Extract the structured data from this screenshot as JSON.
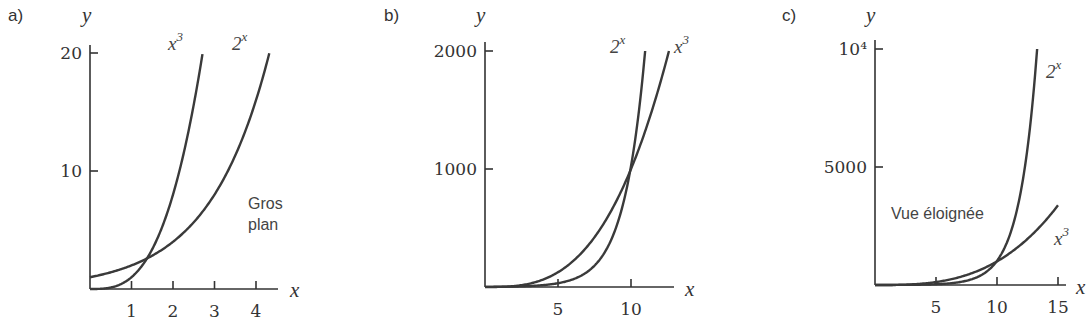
{
  "chart_data": [
    {
      "panel": "a)",
      "type": "line",
      "title": "",
      "xlabel": "x",
      "ylabel": "y",
      "xlim": [
        0,
        4.5
      ],
      "ylim": [
        0,
        20
      ],
      "xticks": [
        1,
        2,
        3,
        4
      ],
      "yticks": [
        10,
        20
      ],
      "ytick_labels": [
        "10",
        "20"
      ],
      "annotation": "Gros\nplan",
      "series": [
        {
          "name": "x^3",
          "label": "x",
          "sup": "3",
          "func": "cube",
          "x": [
            0,
            0.5,
            1,
            1.26,
            1.5,
            2,
            2.5,
            2.71
          ],
          "values": [
            0,
            0.125,
            1,
            2,
            3.375,
            8,
            15.625,
            20
          ]
        },
        {
          "name": "2^x",
          "label": "2",
          "sup": "x",
          "func": "exp2",
          "x": [
            0,
            1,
            1.37,
            2,
            3,
            4,
            4.32
          ],
          "values": [
            1,
            2,
            2.59,
            4,
            8,
            16,
            20
          ]
        }
      ]
    },
    {
      "panel": "b)",
      "type": "line",
      "title": "",
      "xlabel": "x",
      "ylabel": "y",
      "xlim": [
        0,
        13.5
      ],
      "ylim": [
        0,
        2000
      ],
      "xticks": [
        5,
        10
      ],
      "yticks": [
        1000,
        2000
      ],
      "ytick_labels": [
        "1000",
        "2000"
      ],
      "annotation": "",
      "series": [
        {
          "name": "2^x",
          "label": "2",
          "sup": "x",
          "func": "exp2",
          "x": [
            0,
            5,
            8,
            9.94,
            10,
            10.97
          ],
          "values": [
            1,
            32,
            256,
            982,
            1024,
            2000
          ]
        },
        {
          "name": "x^3",
          "label": "x",
          "sup": "3",
          "func": "cube",
          "x": [
            0,
            5,
            8,
            9.94,
            10,
            12.6
          ],
          "values": [
            0,
            125,
            512,
            982,
            1000,
            2000
          ]
        }
      ]
    },
    {
      "panel": "c)",
      "type": "line",
      "title": "",
      "xlabel": "x",
      "ylabel": "y",
      "xlim": [
        0,
        16
      ],
      "ylim": [
        0,
        10000
      ],
      "xticks": [
        5,
        10,
        15
      ],
      "yticks": [
        5000,
        10000
      ],
      "ytick_labels": [
        "5000",
        "10⁴"
      ],
      "annotation": "Vue éloignée",
      "series": [
        {
          "name": "2^x",
          "label": "2",
          "sup": "x",
          "func": "exp2",
          "x": [
            0,
            5,
            10,
            12,
            13.29
          ],
          "values": [
            1,
            32,
            1024,
            4096,
            10000
          ]
        },
        {
          "name": "x^3",
          "label": "x",
          "sup": "3",
          "func": "cube",
          "x": [
            0,
            5,
            10,
            15
          ],
          "values": [
            0,
            125,
            1000,
            3375
          ]
        }
      ]
    }
  ],
  "layout": [
    {
      "label_pos": [
        8,
        21
      ],
      "origin": [
        90,
        289
      ],
      "x_unit": 41.5,
      "y_top": 53,
      "x_axis_end": 278,
      "y_axis_top": 45,
      "ylabel_pos": [
        82,
        22
      ],
      "xlabel_pos": [
        290,
        297
      ],
      "series_label_pos": [
        [
          168,
          50
        ],
        [
          232,
          50
        ]
      ],
      "annot_pos": [
        248,
        209
      ]
    },
    {
      "label_pos": [
        384,
        21
      ],
      "origin": [
        485,
        287
      ],
      "x_unit": 14.6,
      "y_top": 51,
      "x_axis_end": 674,
      "y_axis_top": 42,
      "ylabel_pos": [
        476,
        22
      ],
      "xlabel_pos": [
        685,
        296
      ],
      "series_label_pos": [
        [
          610,
          53
        ],
        [
          674,
          53
        ]
      ],
      "annot_pos": null
    },
    {
      "label_pos": [
        782,
        21
      ],
      "origin": [
        875,
        285
      ],
      "x_unit": 12.2,
      "y_top": 49,
      "x_axis_end": 1066,
      "y_axis_top": 40,
      "ylabel_pos": [
        866,
        22
      ],
      "xlabel_pos": [
        1076,
        294
      ],
      "series_label_pos": [
        [
          1046,
          78
        ],
        [
          1054,
          245
        ]
      ],
      "annot_pos": [
        891,
        219
      ]
    }
  ]
}
